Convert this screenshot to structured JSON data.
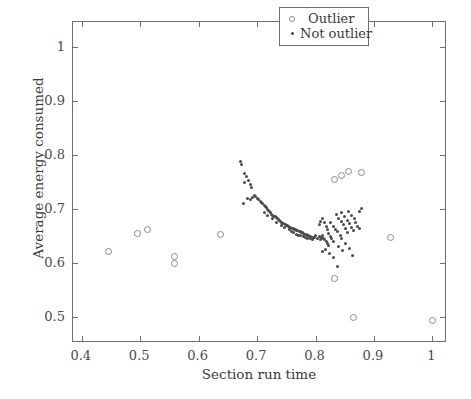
{
  "chart_data": {
    "type": "scatter",
    "title": "",
    "xlabel": "Section run time",
    "ylabel": "Average energy consumed",
    "xlim": [
      0.385,
      1.025
    ],
    "ylim": [
      0.452,
      1.047
    ],
    "xticks": [
      0.4,
      0.5,
      0.6,
      0.7,
      0.8,
      0.9,
      1.0
    ],
    "xticklabels": [
      "0.4",
      "0.5",
      "0.6",
      "0.7",
      "0.8",
      "0.9",
      "1"
    ],
    "yticks": [
      0.5,
      0.6,
      0.7,
      0.8,
      0.9,
      1.0
    ],
    "yticklabels": [
      "0.5",
      "0.6",
      "0.7",
      "0.8",
      "0.9",
      "1"
    ],
    "grid": false,
    "legend_position": "upper right",
    "series": [
      {
        "name": "Outlier",
        "marker": "open-circle",
        "color": "#8a8a92",
        "points": [
          [
            0.445,
            0.622
          ],
          [
            0.495,
            0.655
          ],
          [
            0.512,
            0.662
          ],
          [
            0.558,
            0.613
          ],
          [
            0.558,
            0.6
          ],
          [
            0.638,
            0.653
          ],
          [
            0.833,
            0.755
          ],
          [
            0.845,
            0.763
          ],
          [
            0.856,
            0.77
          ],
          [
            0.878,
            0.768
          ],
          [
            0.833,
            0.572
          ],
          [
            0.865,
            0.5
          ],
          [
            0.928,
            0.647
          ],
          [
            1.0,
            0.493
          ]
        ]
      },
      {
        "name": "Not outlier",
        "marker": "dot",
        "color": "#4a4a50",
        "points": [
          [
            0.672,
            0.789
          ],
          [
            0.674,
            0.783
          ],
          [
            0.678,
            0.766
          ],
          [
            0.682,
            0.761
          ],
          [
            0.685,
            0.753
          ],
          [
            0.679,
            0.749
          ],
          [
            0.688,
            0.746
          ],
          [
            0.69,
            0.741
          ],
          [
            0.676,
            0.71
          ],
          [
            0.684,
            0.72
          ],
          [
            0.688,
            0.718
          ],
          [
            0.692,
            0.722
          ],
          [
            0.695,
            0.726
          ],
          [
            0.698,
            0.724
          ],
          [
            0.7,
            0.72
          ],
          [
            0.703,
            0.718
          ],
          [
            0.705,
            0.715
          ],
          [
            0.707,
            0.712
          ],
          [
            0.71,
            0.71
          ],
          [
            0.712,
            0.707
          ],
          [
            0.714,
            0.705
          ],
          [
            0.716,
            0.703
          ],
          [
            0.718,
            0.7
          ],
          [
            0.72,
            0.698
          ],
          [
            0.722,
            0.696
          ],
          [
            0.723,
            0.693
          ],
          [
            0.725,
            0.691
          ],
          [
            0.727,
            0.689
          ],
          [
            0.729,
            0.687
          ],
          [
            0.731,
            0.686
          ],
          [
            0.733,
            0.684
          ],
          [
            0.735,
            0.682
          ],
          [
            0.736,
            0.68
          ],
          [
            0.738,
            0.679
          ],
          [
            0.74,
            0.677
          ],
          [
            0.742,
            0.676
          ],
          [
            0.744,
            0.674
          ],
          [
            0.746,
            0.673
          ],
          [
            0.748,
            0.672
          ],
          [
            0.75,
            0.67
          ],
          [
            0.752,
            0.669
          ],
          [
            0.754,
            0.668
          ],
          [
            0.756,
            0.667
          ],
          [
            0.758,
            0.666
          ],
          [
            0.76,
            0.665
          ],
          [
            0.762,
            0.664
          ],
          [
            0.764,
            0.663
          ],
          [
            0.766,
            0.662
          ],
          [
            0.768,
            0.661
          ],
          [
            0.77,
            0.66
          ],
          [
            0.772,
            0.659
          ],
          [
            0.774,
            0.658
          ],
          [
            0.776,
            0.657
          ],
          [
            0.778,
            0.656
          ],
          [
            0.78,
            0.655
          ],
          [
            0.782,
            0.654
          ],
          [
            0.784,
            0.653
          ],
          [
            0.786,
            0.652
          ],
          [
            0.788,
            0.651
          ],
          [
            0.79,
            0.65
          ],
          [
            0.792,
            0.649
          ],
          [
            0.794,
            0.648
          ],
          [
            0.796,
            0.648
          ],
          [
            0.798,
            0.647
          ],
          [
            0.712,
            0.694
          ],
          [
            0.726,
            0.682
          ],
          [
            0.741,
            0.67
          ],
          [
            0.755,
            0.662
          ],
          [
            0.763,
            0.656
          ],
          [
            0.771,
            0.652
          ],
          [
            0.779,
            0.649
          ],
          [
            0.787,
            0.646
          ],
          [
            0.795,
            0.644
          ],
          [
            0.718,
            0.688
          ],
          [
            0.733,
            0.676
          ],
          [
            0.747,
            0.666
          ],
          [
            0.759,
            0.659
          ],
          [
            0.767,
            0.654
          ],
          [
            0.775,
            0.651
          ],
          [
            0.783,
            0.648
          ],
          [
            0.791,
            0.645
          ],
          [
            0.8,
            0.651
          ],
          [
            0.803,
            0.646
          ],
          [
            0.806,
            0.65
          ],
          [
            0.808,
            0.644
          ],
          [
            0.81,
            0.648
          ],
          [
            0.812,
            0.652
          ],
          [
            0.814,
            0.646
          ],
          [
            0.816,
            0.643
          ],
          [
            0.818,
            0.64
          ],
          [
            0.82,
            0.636
          ],
          [
            0.822,
            0.632
          ],
          [
            0.806,
            0.672
          ],
          [
            0.809,
            0.678
          ],
          [
            0.812,
            0.682
          ],
          [
            0.815,
            0.676
          ],
          [
            0.818,
            0.668
          ],
          [
            0.82,
            0.662
          ],
          [
            0.823,
            0.655
          ],
          [
            0.826,
            0.649
          ],
          [
            0.828,
            0.645
          ],
          [
            0.83,
            0.64
          ],
          [
            0.826,
            0.675
          ],
          [
            0.83,
            0.668
          ],
          [
            0.834,
            0.663
          ],
          [
            0.838,
            0.658
          ],
          [
            0.842,
            0.652
          ],
          [
            0.845,
            0.646
          ],
          [
            0.836,
            0.69
          ],
          [
            0.84,
            0.683
          ],
          [
            0.844,
            0.677
          ],
          [
            0.848,
            0.671
          ],
          [
            0.852,
            0.664
          ],
          [
            0.855,
            0.657
          ],
          [
            0.845,
            0.693
          ],
          [
            0.85,
            0.686
          ],
          [
            0.854,
            0.679
          ],
          [
            0.858,
            0.673
          ],
          [
            0.861,
            0.666
          ],
          [
            0.865,
            0.66
          ],
          [
            0.857,
            0.695
          ],
          [
            0.862,
            0.688
          ],
          [
            0.866,
            0.683
          ],
          [
            0.869,
            0.676
          ],
          [
            0.872,
            0.668
          ],
          [
            0.875,
            0.664
          ],
          [
            0.878,
            0.702
          ],
          [
            0.876,
            0.695
          ],
          [
            0.84,
            0.63
          ],
          [
            0.846,
            0.624
          ],
          [
            0.852,
            0.637
          ],
          [
            0.858,
            0.627
          ],
          [
            0.864,
            0.614
          ],
          [
            0.838,
            0.593
          ],
          [
            0.83,
            0.611
          ],
          [
            0.817,
            0.626
          ],
          [
            0.812,
            0.621
          ],
          [
            0.824,
            0.617
          ]
        ]
      }
    ]
  },
  "legend": {
    "entries": [
      {
        "label": "Outlier",
        "marker": "open-circle"
      },
      {
        "label": "Not outlier",
        "marker": "dot"
      }
    ]
  }
}
